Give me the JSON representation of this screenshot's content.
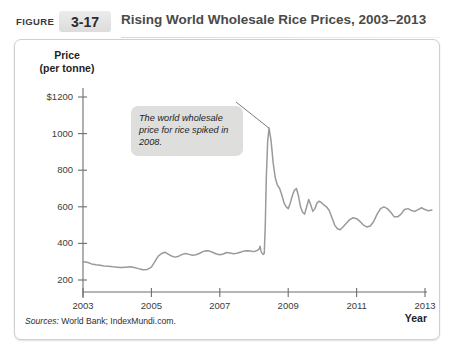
{
  "header": {
    "figure_word": "FIGURE",
    "figure_number": "3-17",
    "title": "Rising World Wholesale Rice Prices, 2003–2013"
  },
  "annotation": {
    "text": "The world wholesale price for rice spiked in 2008."
  },
  "source": {
    "label": "Sources:",
    "text": "World Bank; IndexMundi.com."
  },
  "colors": {
    "line": "#9a9a9a",
    "axis": "#6e6e6e",
    "callout_bg": "#dededc",
    "badge_bg": "#e3e3e3",
    "panel_border": "#cfcfcf",
    "text": "#1f1f1f"
  },
  "chart_data": {
    "type": "line",
    "title": "Rising World Wholesale Rice Prices, 2003–2013",
    "xlabel": "Year",
    "ylabel": "Price (per tonne)",
    "y_unit": "$ per tonne",
    "xlim": [
      2003,
      2013
    ],
    "ylim": [
      0,
      1300
    ],
    "xticks": [
      2003,
      2005,
      2007,
      2009,
      2011,
      2013
    ],
    "xticklabels": [
      "2003",
      "2005",
      "2007",
      "2009",
      "2011",
      "2013"
    ],
    "yticks": [
      200,
      400,
      600,
      800,
      1000,
      1200
    ],
    "yticklabels": [
      "200",
      "400",
      "600",
      "800",
      "1000",
      "$1200"
    ],
    "grid": false,
    "legend": false,
    "series": [
      {
        "name": "World wholesale rice price",
        "color": "#9a9a9a",
        "points": [
          [
            2003.0,
            300
          ],
          [
            2003.12,
            297
          ],
          [
            2003.25,
            288
          ],
          [
            2003.38,
            283
          ],
          [
            2003.5,
            280
          ],
          [
            2003.62,
            277
          ],
          [
            2003.75,
            275
          ],
          [
            2003.88,
            272
          ],
          [
            2004.0,
            270
          ],
          [
            2004.12,
            268
          ],
          [
            2004.25,
            270
          ],
          [
            2004.38,
            272
          ],
          [
            2004.5,
            268
          ],
          [
            2004.62,
            262
          ],
          [
            2004.75,
            256
          ],
          [
            2004.88,
            258
          ],
          [
            2005.0,
            270
          ],
          [
            2005.1,
            300
          ],
          [
            2005.2,
            330
          ],
          [
            2005.3,
            345
          ],
          [
            2005.4,
            352
          ],
          [
            2005.5,
            340
          ],
          [
            2005.6,
            330
          ],
          [
            2005.7,
            325
          ],
          [
            2005.8,
            330
          ],
          [
            2005.9,
            340
          ],
          [
            2006.0,
            345
          ],
          [
            2006.1,
            340
          ],
          [
            2006.2,
            335
          ],
          [
            2006.3,
            338
          ],
          [
            2006.4,
            345
          ],
          [
            2006.5,
            355
          ],
          [
            2006.6,
            360
          ],
          [
            2006.7,
            358
          ],
          [
            2006.8,
            350
          ],
          [
            2006.9,
            342
          ],
          [
            2007.0,
            338
          ],
          [
            2007.1,
            342
          ],
          [
            2007.2,
            350
          ],
          [
            2007.3,
            348
          ],
          [
            2007.4,
            344
          ],
          [
            2007.5,
            346
          ],
          [
            2007.6,
            352
          ],
          [
            2007.7,
            358
          ],
          [
            2007.8,
            360
          ],
          [
            2007.9,
            358
          ],
          [
            2008.0,
            355
          ],
          [
            2008.05,
            358
          ],
          [
            2008.1,
            362
          ],
          [
            2008.15,
            370
          ],
          [
            2008.18,
            385
          ],
          [
            2008.2,
            360
          ],
          [
            2008.24,
            345
          ],
          [
            2008.27,
            340
          ],
          [
            2008.3,
            345
          ],
          [
            2008.33,
            500
          ],
          [
            2008.36,
            760
          ],
          [
            2008.4,
            960
          ],
          [
            2008.44,
            1030
          ],
          [
            2008.5,
            960
          ],
          [
            2008.56,
            840
          ],
          [
            2008.62,
            760
          ],
          [
            2008.68,
            720
          ],
          [
            2008.75,
            700
          ],
          [
            2008.82,
            660
          ],
          [
            2008.88,
            620
          ],
          [
            2008.94,
            600
          ],
          [
            2009.0,
            590
          ],
          [
            2009.06,
            620
          ],
          [
            2009.12,
            660
          ],
          [
            2009.18,
            690
          ],
          [
            2009.24,
            700
          ],
          [
            2009.3,
            660
          ],
          [
            2009.36,
            600
          ],
          [
            2009.42,
            570
          ],
          [
            2009.48,
            560
          ],
          [
            2009.54,
            600
          ],
          [
            2009.6,
            640
          ],
          [
            2009.66,
            610
          ],
          [
            2009.72,
            575
          ],
          [
            2009.78,
            590
          ],
          [
            2009.84,
            620
          ],
          [
            2009.9,
            630
          ],
          [
            2009.96,
            625
          ],
          [
            2010.04,
            610
          ],
          [
            2010.12,
            600
          ],
          [
            2010.2,
            580
          ],
          [
            2010.28,
            540
          ],
          [
            2010.36,
            500
          ],
          [
            2010.44,
            480
          ],
          [
            2010.52,
            475
          ],
          [
            2010.6,
            490
          ],
          [
            2010.7,
            510
          ],
          [
            2010.8,
            530
          ],
          [
            2010.9,
            540
          ],
          [
            2011.0,
            535
          ],
          [
            2011.1,
            520
          ],
          [
            2011.2,
            500
          ],
          [
            2011.3,
            490
          ],
          [
            2011.4,
            495
          ],
          [
            2011.5,
            520
          ],
          [
            2011.6,
            560
          ],
          [
            2011.7,
            590
          ],
          [
            2011.8,
            600
          ],
          [
            2011.9,
            590
          ],
          [
            2012.0,
            570
          ],
          [
            2012.1,
            545
          ],
          [
            2012.2,
            545
          ],
          [
            2012.3,
            560
          ],
          [
            2012.4,
            585
          ],
          [
            2012.5,
            590
          ],
          [
            2012.6,
            580
          ],
          [
            2012.7,
            575
          ],
          [
            2012.8,
            585
          ],
          [
            2012.9,
            595
          ],
          [
            2013.0,
            585
          ],
          [
            2013.1,
            578
          ],
          [
            2013.2,
            582
          ]
        ]
      }
    ],
    "annotations": [
      {
        "text": "The world wholesale price for rice spiked in 2008.",
        "points_to_x": 2008.44,
        "points_to_y": 1030
      }
    ]
  }
}
